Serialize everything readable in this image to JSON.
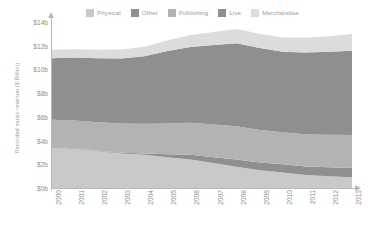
{
  "chart_data": {
    "type": "area",
    "title": "",
    "subtitle": "",
    "xlabel": "",
    "ylabel": "Recorded music revenue ($ Billion)",
    "stacked": true,
    "grid": false,
    "legend_position": "top",
    "x": [
      2000,
      2001,
      2002,
      2003,
      2004,
      2005,
      2006,
      2007,
      2008,
      2009,
      2010,
      2011,
      2012,
      2013
    ],
    "categories": [
      "2000",
      "2001",
      "2002",
      "2003",
      "2004",
      "2005",
      "2006",
      "2007",
      "2008",
      "2009",
      "2010",
      "2011",
      "2012",
      "2013"
    ],
    "xlim": [
      2000,
      2013
    ],
    "ylim": [
      0,
      14
    ],
    "yticks": [
      0,
      2,
      4,
      6,
      8,
      10,
      12,
      14
    ],
    "ytick_labels": [
      "$0b",
      "$2b",
      "$4b",
      "$6b",
      "$8b",
      "$10b",
      "$12b",
      "$14b"
    ],
    "series": [
      {
        "name": "Physical",
        "color": "#c9c9c9",
        "values": [
          3.4,
          3.3,
          3.1,
          2.9,
          2.8,
          2.6,
          2.4,
          2.1,
          1.8,
          1.5,
          1.3,
          1.1,
          1.0,
          0.9
        ]
      },
      {
        "name": "Other",
        "color": "#8f8f8f",
        "values": [
          0.05,
          0.05,
          0.05,
          0.08,
          0.12,
          0.25,
          0.4,
          0.5,
          0.6,
          0.65,
          0.7,
          0.72,
          0.75,
          0.78
        ]
      },
      {
        "name": "Publishing",
        "color": "#b3b3b3",
        "values": [
          2.3,
          2.35,
          2.4,
          2.45,
          2.5,
          2.6,
          2.7,
          2.75,
          2.8,
          2.75,
          2.7,
          2.7,
          2.75,
          2.8
        ]
      },
      {
        "name": "Live",
        "color": "#8f8f8f",
        "values": [
          5.2,
          5.3,
          5.4,
          5.5,
          5.7,
          6.1,
          6.4,
          6.7,
          7.0,
          6.9,
          6.8,
          6.9,
          7.0,
          7.1
        ]
      },
      {
        "name": "Merchandise",
        "color": "#dcdcdc",
        "values": [
          0.7,
          0.7,
          0.7,
          0.75,
          0.8,
          0.9,
          1.0,
          1.1,
          1.2,
          1.2,
          1.2,
          1.25,
          1.3,
          1.4
        ]
      }
    ],
    "totals": [
      11.65,
      11.7,
      11.65,
      11.68,
      11.92,
      12.45,
      12.9,
      13.15,
      13.4,
      13.0,
      12.7,
      12.67,
      12.8,
      12.98
    ]
  },
  "legend": {
    "items": [
      {
        "label": "Physical",
        "color": "#c9c9c9"
      },
      {
        "label": "Other",
        "color": "#8f8f8f"
      },
      {
        "label": "Publishing",
        "color": "#b3b3b3"
      },
      {
        "label": "Live",
        "color": "#8f8f8f"
      },
      {
        "label": "Merchandise",
        "color": "#dcdcdc"
      }
    ]
  },
  "axes": {
    "y_title": "Recorded music revenue ($ Billion)"
  }
}
